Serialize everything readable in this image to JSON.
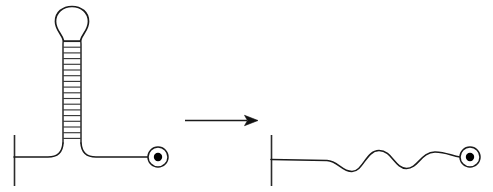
{
  "figure": {
    "background_color": "#ffffff",
    "line_color": "#1a1a1a",
    "rung_color": "#3a3a3a",
    "dot_color": "#000000",
    "width": 493,
    "height": 192
  },
  "left_panel": {
    "label": "folded-hairpin-structure",
    "five_prime_tick": {
      "label": "5-prime-end-tick",
      "x": 14,
      "y_top": 135,
      "y_bottom": 186
    },
    "baseline": {
      "label": "single-stranded-backbone",
      "y": 157,
      "x_start": 14,
      "x_end": 148
    },
    "stem": {
      "label": "double-stranded-stem",
      "x_left_rail": 63,
      "x_right_rail": 81,
      "y_top": 40,
      "y_bottom": 143,
      "base_pair_count": 18,
      "rung_spacing": 5.7
    },
    "loop": {
      "label": "terminal-hairpin-loop",
      "center_x": 72,
      "center_y": 23,
      "radius_x": 17,
      "radius_y": 16
    },
    "three_prime_marker": {
      "label": "3-prime-end-circle",
      "center_x": 158,
      "center_y": 157,
      "outer_radius": 10,
      "dot_radius": 4.2
    }
  },
  "arrow": {
    "label": "transition-arrow",
    "direction": "right",
    "x_start": 185,
    "x_end": 258,
    "y": 120,
    "head_length": 13,
    "head_half_width": 5
  },
  "right_panel": {
    "label": "unfolded-linear-structure",
    "five_prime_tick": {
      "label": "5-prime-end-tick",
      "x": 271,
      "y_top": 135,
      "y_bottom": 186
    },
    "strand": {
      "label": "wavy-single-strand",
      "y_baseline": 160,
      "x_start": 271,
      "x_end": 460,
      "wave_count": 2,
      "wave_amplitude": 9
    },
    "three_prime_marker": {
      "label": "3-prime-end-circle",
      "center_x": 470,
      "center_y": 157,
      "outer_radius": 10,
      "dot_radius": 4.2
    }
  }
}
